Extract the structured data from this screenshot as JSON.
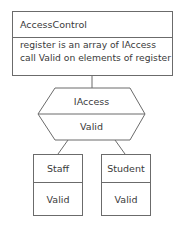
{
  "diagram": {
    "access_control": {
      "name": "AccessControl",
      "notes": [
        "register is an array of IAccess",
        "call Valid on elements of register"
      ]
    },
    "interface": {
      "name": "IAccess",
      "operation": "Valid"
    },
    "implementations": [
      {
        "name": "Staff",
        "operation": "Valid"
      },
      {
        "name": "Student",
        "operation": "Valid"
      }
    ],
    "colors": {
      "line": "#6b6b6b",
      "text": "#3a3a3a",
      "background": "#ffffff"
    }
  }
}
